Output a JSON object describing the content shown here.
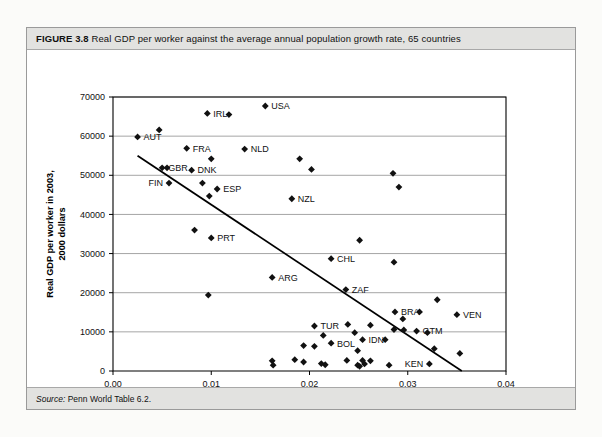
{
  "figure": {
    "label": "FIGURE 3.8",
    "caption": "Real GDP per worker against the average annual population growth rate, 65 countries",
    "source_prefix": "Source:",
    "source_text": "Penn World Table 6.2."
  },
  "chart_data": {
    "type": "scatter",
    "title": "Real GDP per worker against the average annual population growth rate, 65 countries",
    "xlabel": "Average annual population growth rate, 1960–2003",
    "ylabel": "Real GDP per worker in 2003,\n2000 dollars",
    "ylabel_line1": "Real GDP per worker in 2003,",
    "ylabel_line2": "2000 dollars",
    "xlim": [
      0.0,
      0.04
    ],
    "ylim": [
      0,
      70000
    ],
    "xticks": [
      0.0,
      0.01,
      0.02,
      0.03,
      0.04
    ],
    "xticklabels": [
      "0.00",
      "0.01",
      "0.02",
      "0.03",
      "0.04"
    ],
    "yticks": [
      0,
      10000,
      20000,
      30000,
      40000,
      50000,
      60000,
      70000
    ],
    "yticklabels": [
      "0",
      "10000",
      "20000",
      "30000",
      "40000",
      "50000",
      "60000",
      "70000"
    ],
    "grid": "horizontal",
    "legend": "none",
    "marker": "diamond",
    "trendline": {
      "label": "linear fit",
      "x": [
        0.0025,
        0.0355
      ],
      "y": [
        55000,
        0
      ]
    },
    "points": [
      {
        "label": "AUT",
        "x": 0.0025,
        "y": 59800,
        "label_pos": "right"
      },
      {
        "label": "",
        "x": 0.0047,
        "y": 61600
      },
      {
        "label": "IRL",
        "x": 0.0096,
        "y": 65800,
        "label_pos": "right"
      },
      {
        "label": "",
        "x": 0.0118,
        "y": 65500
      },
      {
        "label": "USA",
        "x": 0.0155,
        "y": 67700,
        "label_pos": "right"
      },
      {
        "label": "FRA",
        "x": 0.0075,
        "y": 56900,
        "label_pos": "right"
      },
      {
        "label": "NLD",
        "x": 0.0134,
        "y": 56700,
        "label_pos": "right"
      },
      {
        "label": "",
        "x": 0.01,
        "y": 54200
      },
      {
        "label": "",
        "x": 0.019,
        "y": 54200
      },
      {
        "label": "GBR",
        "x": 0.005,
        "y": 51900,
        "label_pos": "right"
      },
      {
        "label": "",
        "x": 0.0055,
        "y": 51900
      },
      {
        "label": "DNK",
        "x": 0.008,
        "y": 51300,
        "label_pos": "right"
      },
      {
        "label": "",
        "x": 0.0202,
        "y": 51500
      },
      {
        "label": "",
        "x": 0.0285,
        "y": 50500
      },
      {
        "label": "FIN",
        "x": 0.0057,
        "y": 48000,
        "label_pos": "left"
      },
      {
        "label": "",
        "x": 0.0091,
        "y": 48000
      },
      {
        "label": "ESP",
        "x": 0.0106,
        "y": 46500,
        "label_pos": "right"
      },
      {
        "label": "",
        "x": 0.0098,
        "y": 44700
      },
      {
        "label": "",
        "x": 0.0291,
        "y": 47000
      },
      {
        "label": "NZL",
        "x": 0.0182,
        "y": 44000,
        "label_pos": "right"
      },
      {
        "label": "",
        "x": 0.0083,
        "y": 36000
      },
      {
        "label": "PRT",
        "x": 0.01,
        "y": 34000,
        "label_pos": "right"
      },
      {
        "label": "",
        "x": 0.0251,
        "y": 33400
      },
      {
        "label": "CHL",
        "x": 0.0222,
        "y": 28700,
        "label_pos": "right"
      },
      {
        "label": "",
        "x": 0.0286,
        "y": 27800
      },
      {
        "label": "ARG",
        "x": 0.0162,
        "y": 23900,
        "label_pos": "right"
      },
      {
        "label": "ZAF",
        "x": 0.0237,
        "y": 20800,
        "label_pos": "right"
      },
      {
        "label": "",
        "x": 0.0097,
        "y": 19400
      },
      {
        "label": "",
        "x": 0.033,
        "y": 18200
      },
      {
        "label": "BRA",
        "x": 0.0287,
        "y": 15100,
        "label_pos": "right"
      },
      {
        "label": "",
        "x": 0.0312,
        "y": 15100
      },
      {
        "label": "VEN",
        "x": 0.035,
        "y": 14400,
        "label_pos": "right"
      },
      {
        "label": "",
        "x": 0.0295,
        "y": 13300
      },
      {
        "label": "",
        "x": 0.0239,
        "y": 11900
      },
      {
        "label": "TUR",
        "x": 0.0205,
        "y": 11500,
        "label_pos": "right"
      },
      {
        "label": "",
        "x": 0.0262,
        "y": 11700
      },
      {
        "label": "",
        "x": 0.0286,
        "y": 10600
      },
      {
        "label": "",
        "x": 0.0296,
        "y": 10500
      },
      {
        "label": "GTM",
        "x": 0.0309,
        "y": 10200,
        "label_pos": "right"
      },
      {
        "label": "",
        "x": 0.032,
        "y": 9800
      },
      {
        "label": "",
        "x": 0.0246,
        "y": 9800
      },
      {
        "label": "",
        "x": 0.0214,
        "y": 9100
      },
      {
        "label": "IDN",
        "x": 0.0254,
        "y": 8000,
        "label_pos": "right"
      },
      {
        "label": "",
        "x": 0.0277,
        "y": 8000
      },
      {
        "label": "BOL",
        "x": 0.0222,
        "y": 7100,
        "label_pos": "right"
      },
      {
        "label": "",
        "x": 0.0194,
        "y": 6500
      },
      {
        "label": "",
        "x": 0.0205,
        "y": 6300
      },
      {
        "label": "",
        "x": 0.0249,
        "y": 5200
      },
      {
        "label": "",
        "x": 0.0327,
        "y": 5700
      },
      {
        "label": "",
        "x": 0.0353,
        "y": 4500
      },
      {
        "label": "",
        "x": 0.0162,
        "y": 2600
      },
      {
        "label": "",
        "x": 0.0163,
        "y": 1500
      },
      {
        "label": "",
        "x": 0.0185,
        "y": 2900
      },
      {
        "label": "",
        "x": 0.0194,
        "y": 2300
      },
      {
        "label": "",
        "x": 0.0212,
        "y": 1900
      },
      {
        "label": "",
        "x": 0.0216,
        "y": 1600
      },
      {
        "label": "",
        "x": 0.0238,
        "y": 2700
      },
      {
        "label": "",
        "x": 0.0249,
        "y": 1500
      },
      {
        "label": "",
        "x": 0.0251,
        "y": 1200
      },
      {
        "label": "",
        "x": 0.0254,
        "y": 2700
      },
      {
        "label": "",
        "x": 0.0256,
        "y": 1800
      },
      {
        "label": "",
        "x": 0.0262,
        "y": 2600
      },
      {
        "label": "",
        "x": 0.0281,
        "y": 1500
      },
      {
        "label": "KEN",
        "x": 0.0322,
        "y": 1800,
        "label_pos": "left"
      }
    ]
  }
}
